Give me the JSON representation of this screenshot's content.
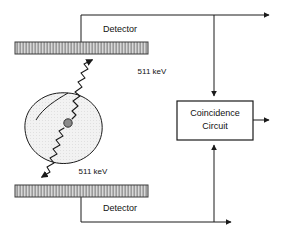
{
  "diagram": {
    "type": "schematic",
    "background_color": "#ffffff",
    "line_color": "#1a1a1a",
    "detector_fill_color": "#8f8f8f",
    "detector_stripe_color": "#d9d9d9",
    "phantom_fill_color": "#efefef",
    "source_dot_color": "#8a8a8a",
    "nodes": {
      "detector_top": {
        "label": "Detector",
        "label_x": 120,
        "label_y": 30,
        "bar_x": 15,
        "bar_y": 42,
        "bar_w": 133,
        "bar_h": 12
      },
      "detector_bottom": {
        "label": "Detector",
        "label_x": 120,
        "label_y": 209,
        "bar_x": 15,
        "bar_y": 185,
        "bar_w": 133,
        "bar_h": 12
      },
      "coincidence_circuit": {
        "line1": "Coincidence",
        "line2": "Circuit",
        "x": 177,
        "y": 101,
        "w": 76,
        "h": 39
      },
      "phantom": {
        "label": "patient-phantom",
        "center_x": 70,
        "center_y": 125
      },
      "source_point": {
        "label": "annihilation-site",
        "cx": 68,
        "cy": 123,
        "r": 4
      }
    },
    "annotations": [
      {
        "id": "gamma-up-energy",
        "text": "511 keV",
        "x": 152,
        "y": 72
      },
      {
        "id": "gamma-down-energy",
        "text": "511 keV",
        "x": 93,
        "y": 172
      }
    ],
    "gamma_rays": [
      {
        "id": "gamma-ray-up",
        "energy": "511 keV",
        "direction": "up-right",
        "from": "annihilation-site",
        "to": "detector-top"
      },
      {
        "id": "gamma-ray-down",
        "energy": "511 keV",
        "direction": "down-left",
        "from": "annihilation-site",
        "to": "detector-bottom"
      }
    ],
    "signal_paths": [
      {
        "id": "top-detector-to-coincidence",
        "from": "detector-top",
        "to": "coincidence-circuit"
      },
      {
        "id": "bottom-detector-to-coincidence",
        "from": "detector-bottom",
        "to": "coincidence-circuit"
      },
      {
        "id": "top-branch-output",
        "from": "detector-top",
        "to": "right-edge"
      },
      {
        "id": "bottom-branch-output",
        "from": "detector-bottom",
        "to": "right-edge"
      },
      {
        "id": "coincidence-output",
        "from": "coincidence-circuit",
        "to": "right-edge"
      }
    ]
  }
}
